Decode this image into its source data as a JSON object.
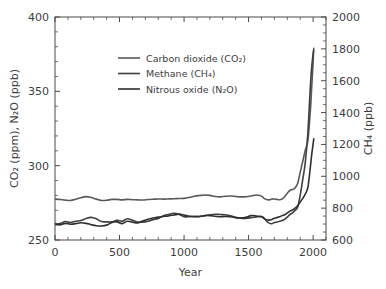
{
  "chart_data": {
    "type": "line",
    "title": "",
    "xlabel": "Year",
    "ylabel_left": "CO₂ (ppm), N₂O (ppb)",
    "ylabel_right": "CH₄ (ppb)",
    "xlim": [
      0,
      2100
    ],
    "ylim_left": [
      250,
      400
    ],
    "ylim_right": [
      600,
      2000
    ],
    "xticks": [
      0,
      500,
      1000,
      1500,
      2000
    ],
    "xticklabels": [
      "0",
      "500",
      "1000",
      "1500",
      "2000"
    ],
    "yticks_left": [
      250,
      300,
      350,
      400
    ],
    "yticklabels_left": [
      "250",
      "300",
      "350",
      "400"
    ],
    "yticks_right": [
      600,
      800,
      1000,
      1200,
      1400,
      1600,
      1800,
      2000
    ],
    "yticklabels_right": [
      "600",
      "800",
      "1000",
      "1200",
      "1400",
      "1600",
      "1800",
      "2000"
    ],
    "grid": false,
    "legend_position": "upper-left",
    "minor_ticks_per_major_x": 5,
    "minor_ticks_per_major_y_left": 5,
    "minor_ticks_per_major_y_right": 4,
    "series": [
      {
        "name": "Carbon dioxide (CO₂)",
        "axis": "left",
        "unit": "ppm",
        "color": "#595959",
        "width": 1.6,
        "x": [
          0,
          40,
          80,
          120,
          160,
          200,
          240,
          280,
          320,
          360,
          400,
          440,
          480,
          520,
          560,
          600,
          640,
          680,
          720,
          760,
          800,
          840,
          880,
          920,
          960,
          1000,
          1040,
          1080,
          1120,
          1160,
          1200,
          1240,
          1280,
          1320,
          1360,
          1400,
          1440,
          1480,
          1520,
          1560,
          1600,
          1620,
          1640,
          1660,
          1680,
          1700,
          1720,
          1740,
          1760,
          1780,
          1800,
          1820,
          1840,
          1860,
          1880,
          1900,
          1920,
          1940,
          1960,
          1980,
          1990,
          2000,
          2005
        ],
        "values": [
          277.5,
          277.2,
          276.8,
          276.6,
          277.4,
          278.4,
          279.2,
          278.6,
          277.5,
          276.6,
          276.7,
          277.3,
          277.3,
          277.0,
          277.3,
          277.1,
          277.0,
          276.9,
          277.2,
          277.4,
          277.6,
          277.5,
          277.6,
          277.7,
          277.9,
          278.0,
          278.6,
          279.4,
          279.9,
          280.3,
          280.0,
          279.3,
          279.0,
          279.4,
          279.6,
          279.3,
          279.0,
          279.1,
          279.6,
          280.3,
          279.5,
          278.0,
          277.2,
          277.0,
          277.5,
          277.6,
          277.3,
          277.1,
          277.6,
          279.2,
          281.5,
          283.3,
          284.0,
          285.0,
          288.0,
          295.5,
          303.0,
          310.5,
          317.0,
          338.5,
          354.0,
          369.5,
          379.0
        ]
      },
      {
        "name": "Methane (CH₄)",
        "axis": "right",
        "unit": "ppb",
        "color": "#3f3f3f",
        "width": 1.6,
        "x": [
          0,
          40,
          80,
          120,
          160,
          200,
          240,
          280,
          320,
          360,
          400,
          440,
          480,
          520,
          560,
          600,
          640,
          680,
          720,
          760,
          800,
          840,
          880,
          920,
          960,
          1000,
          1040,
          1080,
          1120,
          1160,
          1200,
          1240,
          1280,
          1320,
          1360,
          1400,
          1440,
          1480,
          1520,
          1560,
          1600,
          1620,
          1640,
          1660,
          1680,
          1700,
          1720,
          1740,
          1760,
          1780,
          1800,
          1820,
          1840,
          1860,
          1880,
          1900,
          1920,
          1940,
          1960,
          1980,
          1990,
          2000,
          2005
        ],
        "values": [
          700,
          703,
          716,
          710,
          718,
          722,
          735,
          742,
          733,
          716,
          714,
          714,
          723,
          718,
          733,
          724,
          712,
          712,
          718,
          728,
          735,
          752,
          760,
          768,
          762,
          746,
          748,
          747,
          748,
          752,
          758,
          762,
          760,
          758,
          752,
          742,
          737,
          736,
          740,
          745,
          748,
          738,
          718,
          706,
          702,
          710,
          712,
          718,
          722,
          730,
          744,
          760,
          770,
          786,
          806,
          880,
          980,
          1090,
          1280,
          1580,
          1690,
          1770,
          1790
        ]
      },
      {
        "name": "Nitrous oxide (N₂O)",
        "axis": "left",
        "unit": "ppb",
        "color": "#2e2e2e",
        "width": 1.6,
        "x": [
          0,
          40,
          80,
          120,
          160,
          200,
          240,
          280,
          320,
          360,
          400,
          440,
          480,
          520,
          560,
          600,
          640,
          680,
          720,
          760,
          800,
          840,
          880,
          920,
          960,
          1000,
          1040,
          1080,
          1120,
          1160,
          1200,
          1240,
          1280,
          1320,
          1360,
          1400,
          1440,
          1480,
          1520,
          1560,
          1600,
          1620,
          1640,
          1660,
          1680,
          1700,
          1720,
          1740,
          1760,
          1780,
          1800,
          1820,
          1840,
          1860,
          1880,
          1900,
          1920,
          1940,
          1960,
          1980,
          1990,
          2000,
          2005
        ],
        "values": [
          261.0,
          260.2,
          261.2,
          260.6,
          261.0,
          261.6,
          261.2,
          260.3,
          259.6,
          259.4,
          260.0,
          261.8,
          262.2,
          261.0,
          262.6,
          262.0,
          261.4,
          262.8,
          264.0,
          264.8,
          265.4,
          265.8,
          266.2,
          266.8,
          267.4,
          266.8,
          265.9,
          265.8,
          265.8,
          266.4,
          266.4,
          266.0,
          265.6,
          265.8,
          265.6,
          265.0,
          264.8,
          265.2,
          266.4,
          266.2,
          265.6,
          264.4,
          263.6,
          263.4,
          263.8,
          264.6,
          265.2,
          265.6,
          266.4,
          267.0,
          268.2,
          269.4,
          270.2,
          271.4,
          273.0,
          275.5,
          278.0,
          281.0,
          285.5,
          300.0,
          308.0,
          314.5,
          318.0
        ]
      }
    ],
    "annotations": []
  },
  "legend": {
    "entries": [
      {
        "label": "Carbon dioxide (CO₂)"
      },
      {
        "label": "Methane (CH₄)"
      },
      {
        "label": "Nitrous oxide (N₂O)"
      }
    ]
  }
}
